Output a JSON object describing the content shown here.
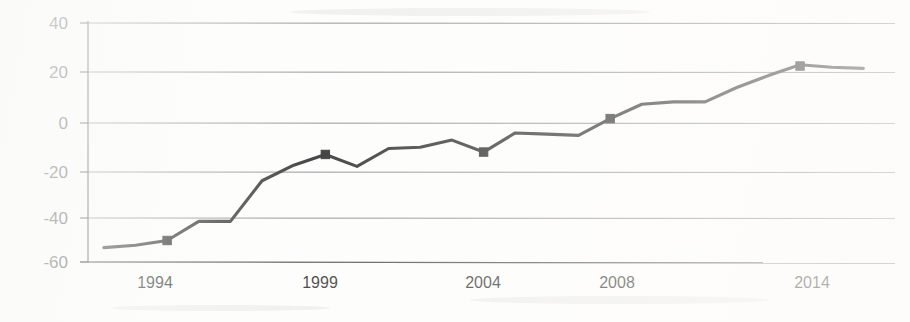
{
  "chart_data": {
    "type": "line",
    "title": "",
    "subtitle": "",
    "xlabel": "",
    "ylabel": "",
    "grid": true,
    "legend": "none",
    "xlim": [
      1991.5,
      2017.0
    ],
    "ylim": [
      -60,
      40
    ],
    "y_ticks": [
      40,
      20,
      0,
      -20,
      -40,
      -60
    ],
    "y_tick_labels": [
      "40",
      "20",
      "0",
      "-20",
      "-40",
      "-60"
    ],
    "x_ticks": [
      1994,
      1999,
      2004,
      2008,
      2014
    ],
    "x_tick_labels": [
      "1994",
      "1999",
      "2004",
      "2008",
      "2014"
    ],
    "series": [
      {
        "name": "series-1",
        "marker": "square",
        "marker_x": [
          1994,
          1999,
          2004,
          2008,
          2014
        ],
        "marker_y": [
          -51,
          -15,
          -14,
          0,
          22
        ],
        "x": [
          1992.0,
          1993.0,
          1994.0,
          1995.0,
          1996.0,
          1997.0,
          1998.0,
          1999.0,
          2000.0,
          2001.0,
          2002.0,
          2003.0,
          2004.0,
          2005.0,
          2006.0,
          2007.0,
          2008.0,
          2009.0,
          2010.0,
          2011.0,
          2012.0,
          2013.0,
          2014.0,
          2015.0,
          2016.0
        ],
        "y": [
          -54.0,
          -53.0,
          -51.0,
          -43.0,
          -43.0,
          -26.0,
          -19.5,
          -15.0,
          -20.0,
          -12.5,
          -12.0,
          -9.0,
          -14.0,
          -6.0,
          -6.5,
          -7.0,
          0.0,
          6.0,
          7.0,
          7.0,
          13.0,
          18.0,
          22.5,
          21.5,
          21.0
        ]
      }
    ]
  },
  "axes": {
    "y_axis_name": "value-axis",
    "x_axis_name": "year-axis"
  }
}
